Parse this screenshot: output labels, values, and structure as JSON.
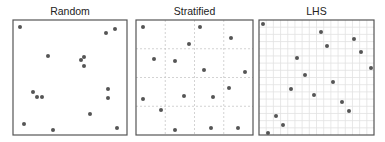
{
  "figure": {
    "panels": [
      {
        "title": "Random",
        "box": {
          "x": 13,
          "y": 20,
          "w": 114,
          "h": 115
        },
        "grid": {
          "type": "none",
          "divisions": 0
        },
        "points": [
          [
            20,
            27
          ],
          [
            48,
            56
          ],
          [
            106,
            33
          ],
          [
            115,
            29
          ],
          [
            81,
            60
          ],
          [
            84,
            57
          ],
          [
            84,
            66
          ],
          [
            33,
            92
          ],
          [
            37,
            97
          ],
          [
            42,
            97
          ],
          [
            108,
            89
          ],
          [
            108,
            98
          ],
          [
            90,
            114
          ],
          [
            24,
            124
          ],
          [
            53,
            130
          ],
          [
            117,
            128
          ]
        ]
      },
      {
        "title": "Stratified",
        "box": {
          "x": 136,
          "y": 20,
          "w": 117,
          "h": 115
        },
        "grid": {
          "type": "strata",
          "divisions": 4
        },
        "points": [
          [
            143,
            27
          ],
          [
            200,
            27
          ],
          [
            231,
            38
          ],
          [
            189,
            44
          ],
          [
            154,
            59
          ],
          [
            175,
            61
          ],
          [
            204,
            70
          ],
          [
            245,
            72
          ],
          [
            229,
            88
          ],
          [
            143,
            99
          ],
          [
            161,
            110
          ],
          [
            184,
            96
          ],
          [
            213,
            97
          ],
          [
            175,
            130
          ],
          [
            211,
            128
          ],
          [
            238,
            128
          ]
        ]
      },
      {
        "title": "LHS",
        "box": {
          "x": 259,
          "y": 20,
          "w": 115,
          "h": 115
        },
        "grid": {
          "type": "fine",
          "divisions": 16
        },
        "points": [
          [
            263,
            24
          ],
          [
            321,
            32
          ],
          [
            354,
            39
          ],
          [
            327,
            46
          ],
          [
            361,
            52
          ],
          [
            297,
            58
          ],
          [
            371,
            68
          ],
          [
            305,
            75
          ],
          [
            333,
            82
          ],
          [
            291,
            89
          ],
          [
            314,
            95
          ],
          [
            342,
            102
          ],
          [
            349,
            111
          ],
          [
            276,
            116
          ],
          [
            283,
            125
          ],
          [
            268,
            133
          ]
        ]
      }
    ],
    "colors": {
      "border": "#555555",
      "grid": "#d4d4d4",
      "point": "#555555",
      "title": "#222222"
    }
  }
}
